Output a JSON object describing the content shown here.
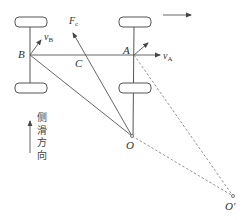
{
  "diagram": {
    "points": {
      "B": {
        "label": "B",
        "x": 30,
        "y": 55
      },
      "A": {
        "label": "A",
        "x": 134,
        "y": 55
      },
      "C": {
        "label": "C",
        "x": 85,
        "y": 55
      },
      "O": {
        "label": "O",
        "x": 132,
        "y": 136
      },
      "O_prime": {
        "label": "O'",
        "x": 233,
        "y": 196
      }
    },
    "labels": {
      "vB_main": "v",
      "vB_sub": "B",
      "vA_main": "v",
      "vA_sub": "A",
      "Fc_main": "F",
      "Fc_sub": "c",
      "B": "B",
      "A": "A",
      "C": "C",
      "O": "O",
      "O_prime": "O'"
    },
    "side_slip": {
      "chars": [
        "侧",
        "滑",
        "方",
        "向"
      ],
      "meaning": "side-slip direction"
    },
    "colors": {
      "line": "#555555",
      "dashed": "#777777",
      "text": "#333333"
    }
  }
}
